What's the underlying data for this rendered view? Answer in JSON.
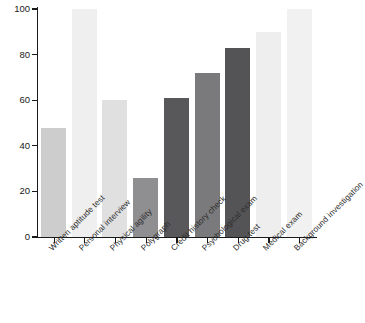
{
  "chart_data": {
    "type": "bar",
    "title": "",
    "subtitle": "",
    "xlabel": "",
    "ylabel": "",
    "ylim": [
      0,
      100
    ],
    "xlim": null,
    "grid": false,
    "legend": null,
    "legend_position": "none",
    "y_ticks": [
      0,
      20,
      40,
      60,
      80,
      100
    ],
    "y_tick_labels": [
      "0",
      "20",
      "40",
      "60",
      "80",
      "100"
    ],
    "categories": [
      "Written aptitude test",
      "Personal interview",
      "Physical agility",
      "Polygraph",
      "Credit history check",
      "Psychological exam",
      "Drug test",
      "Medical exam",
      "Background investigation"
    ],
    "values": [
      48,
      100,
      60,
      26,
      61,
      72,
      83,
      90,
      100
    ],
    "bar_colors": [
      "#cdcdcd",
      "#efefef",
      "#e0e0e0",
      "#8f8f91",
      "#58585a",
      "#7a7a7c",
      "#545456",
      "#eeeeee",
      "#f1f1f1"
    ],
    "axis_color": "#1a1a1a",
    "background_color": "#ffffff"
  }
}
